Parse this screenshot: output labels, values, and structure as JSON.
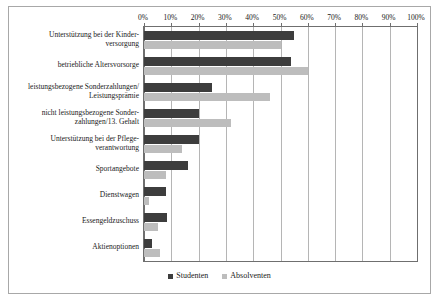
{
  "chart_data": {
    "type": "bar",
    "orientation": "horizontal",
    "title": "",
    "subtitle": "",
    "xlabel": "",
    "ylabel": "",
    "xlim": [
      0,
      100
    ],
    "xtick_labels": [
      "0%",
      "10%",
      "20%",
      "30%",
      "40%",
      "50%",
      "60%",
      "70%",
      "80%",
      "90%",
      "100%"
    ],
    "xtick_values": [
      0,
      10,
      20,
      30,
      40,
      50,
      60,
      70,
      80,
      90,
      100
    ],
    "xaxis_position": "top",
    "grid": "vertical",
    "legend_position": "bottom",
    "categories": [
      "Unterstützung bei der Kinder-\nversorgung",
      "betriebliche Altersvorsorge",
      "leistungsbezogene Sonderzahlungen/\nLeistungsprämie",
      "nicht leistungsbezogene Sonder-\nzahlungen/13. Gehalt",
      "Unterstützung bei der Pflege-\nverantwortung",
      "Sportangebote",
      "Dienstwagen",
      "Essengeldzuschuss",
      "Aktienoptionen"
    ],
    "series": [
      {
        "name": "Studenten",
        "color": "#3d3d3d",
        "values": [
          55,
          54,
          25,
          20,
          20,
          16,
          8,
          8.5,
          3
        ]
      },
      {
        "name": "Absolventen",
        "color": "#bdbdbd",
        "values": [
          50,
          60,
          46,
          32,
          14,
          8,
          2,
          5,
          6
        ]
      }
    ]
  },
  "legend": {
    "items": [
      {
        "label": "Studenten",
        "color": "#3d3d3d"
      },
      {
        "label": "Absolventen",
        "color": "#bdbdbd"
      }
    ]
  },
  "colors": {
    "studenten": "#3d3d3d",
    "absolventen": "#bdbdbd",
    "gridline": "#b5b5b5",
    "axis": "#6f6f6f",
    "frame": "#a8a8a8",
    "text": "#1a1a1a",
    "background": "#ffffff"
  }
}
